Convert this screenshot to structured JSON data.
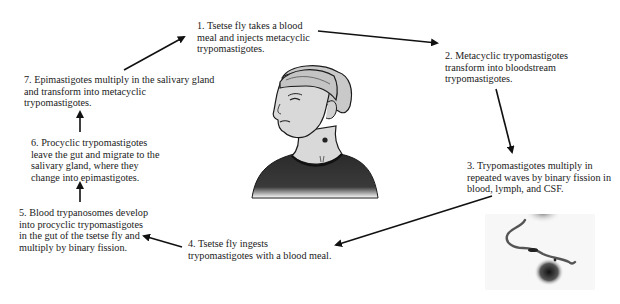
{
  "diagram": {
    "steps": [
      {
        "id": 1,
        "text": "1. Tsetse fly takes a blood\nmeal and injects metacyclic\ntrypomastigotes."
      },
      {
        "id": 2,
        "text": "2.  Metacyclic trypomastigotes\ntransform into bloodstream\ntrypomastigotes."
      },
      {
        "id": 3,
        "text": "3.  Trypomastigotes multiply in\nrepeated waves by binary fission in\nblood, lymph, and CSF."
      },
      {
        "id": 4,
        "text": "4.  Tsetse fly ingests\ntrypomastigotes with a blood meal."
      },
      {
        "id": 5,
        "text": "5.  Blood trypanosomes develop\ninto procyclic trypomastigotes\nin the gut of the tsetse fly and\nmultiply by binary fission."
      },
      {
        "id": 6,
        "text": "6.  Procyclic trypomastigotes\nleave the gut and migrate to the\nsalivary gland, where they\nchange into epimastigotes."
      },
      {
        "id": 7,
        "text": "7.  Epimastigotes multiply in the salivary gland\nand transform into metacyclic\ntrypomastigotes."
      }
    ],
    "arrows": [
      {
        "from": 7,
        "to": 1
      },
      {
        "from": 1,
        "to": 2
      },
      {
        "from": 2,
        "to": 3
      },
      {
        "from": 3,
        "to": 4
      },
      {
        "from": 4,
        "to": 5
      },
      {
        "from": 5,
        "to": 6
      },
      {
        "from": 6,
        "to": 7
      }
    ],
    "illustrations": [
      {
        "name": "human-host-figure",
        "description": "woman with tsetse fly bite on neck"
      },
      {
        "name": "trypanosome-micrograph",
        "description": "micrograph of trypomastigote among blood cells"
      }
    ],
    "colors": {
      "text": "#1a1a1a",
      "arrow": "#111111",
      "skin": "#d9d9d9",
      "shirt": "#2b2b2b"
    }
  }
}
